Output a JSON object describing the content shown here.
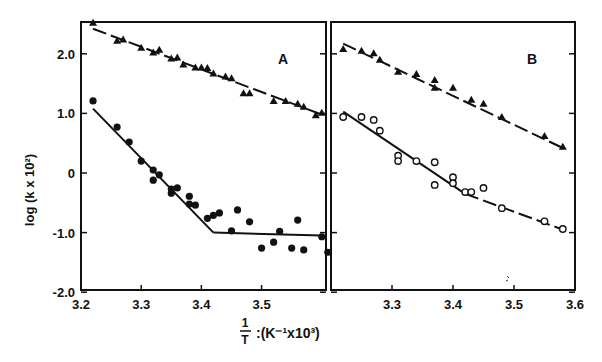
{
  "figure": {
    "ylabel": "log (k x 10²)",
    "xlabel_fraction_num": "1",
    "xlabel_fraction_den": "T",
    "xlabel_rest": ":(K⁻¹x10³)",
    "background": "#ffffff",
    "ink": "#111111"
  },
  "chart_data": [
    {
      "type": "scatter",
      "panel": "A",
      "title": "A",
      "xlabel": "1/T ; (K^-1 x 10^3)",
      "ylabel": "log (k x 10^2)",
      "xlim": [
        3.2,
        3.607
      ],
      "ylim": [
        -2.0,
        2.52
      ],
      "xticks": [
        3.2,
        3.3,
        3.4,
        3.5
      ],
      "yticks": [
        -2.0,
        -1.0,
        0,
        1.0,
        2.0
      ],
      "ytick_labels": [
        "-2.0",
        "-1.0",
        "0",
        "1.0",
        "2.0"
      ],
      "grid": false,
      "series": [
        {
          "name": "filled triangles",
          "marker": "triangle-filled",
          "x": [
            3.22,
            3.26,
            3.27,
            3.3,
            3.32,
            3.33,
            3.35,
            3.36,
            3.37,
            3.39,
            3.4,
            3.41,
            3.42,
            3.44,
            3.45,
            3.47,
            3.48,
            3.52,
            3.54,
            3.56,
            3.57,
            3.59,
            3.6
          ],
          "y": [
            2.52,
            2.22,
            2.24,
            2.1,
            2.02,
            2.07,
            1.92,
            1.94,
            1.82,
            1.77,
            1.77,
            1.76,
            1.67,
            1.62,
            1.59,
            1.34,
            1.34,
            1.21,
            1.21,
            1.16,
            1.11,
            0.97,
            1.01
          ]
        },
        {
          "name": "filled circles",
          "marker": "circle-filled",
          "x": [
            3.22,
            3.26,
            3.28,
            3.3,
            3.32,
            3.32,
            3.33,
            3.35,
            3.35,
            3.36,
            3.38,
            3.38,
            3.39,
            3.41,
            3.42,
            3.43,
            3.46,
            3.45,
            3.48,
            3.5,
            3.52,
            3.53,
            3.55,
            3.56,
            3.57,
            3.6,
            3.61
          ],
          "y": [
            1.21,
            0.77,
            0.52,
            0.2,
            0.05,
            -0.12,
            -0.03,
            -0.27,
            -0.34,
            -0.25,
            -0.39,
            -0.52,
            -0.54,
            -0.76,
            -0.71,
            -0.67,
            -0.62,
            -0.97,
            -0.82,
            -1.26,
            -1.16,
            -0.98,
            -1.26,
            -0.79,
            -1.29,
            -1.07,
            -1.33
          ]
        }
      ],
      "fit_lines": [
        {
          "name": "triangle fit",
          "style": "dashed",
          "points": [
            [
              3.22,
              2.42
            ],
            [
              3.6,
              0.98
            ]
          ]
        },
        {
          "name": "circle fit steep",
          "style": "solid-then-dashed",
          "points": [
            [
              3.22,
              1.08
            ],
            [
              3.42,
              -1.0
            ]
          ]
        },
        {
          "name": "circle fit flat",
          "style": "solid",
          "points": [
            [
              3.42,
              -1.0
            ],
            [
              3.6,
              -1.05
            ]
          ]
        }
      ]
    },
    {
      "type": "scatter",
      "panel": "B",
      "title": "B",
      "xlabel": "1/T ; (K^-1 x 10^3)",
      "ylabel": "log (k x 10^2)",
      "xlim": [
        3.2,
        3.6
      ],
      "ylim": [
        -2.0,
        2.52
      ],
      "xticks": [
        3.3,
        3.4,
        3.5,
        3.6
      ],
      "yticks": [
        -2.0,
        -1.0,
        0,
        1.0,
        2.0
      ],
      "grid": false,
      "series": [
        {
          "name": "filled triangles",
          "marker": "triangle-filled",
          "x": [
            3.22,
            3.25,
            3.27,
            3.28,
            3.31,
            3.34,
            3.37,
            3.37,
            3.4,
            3.43,
            3.45,
            3.48,
            3.55,
            3.58
          ],
          "y": [
            2.08,
            2.05,
            2.01,
            1.9,
            1.7,
            1.66,
            1.56,
            1.43,
            1.43,
            1.23,
            1.16,
            0.94,
            0.62,
            0.44
          ]
        },
        {
          "name": "open circles",
          "marker": "circle-open",
          "x": [
            3.22,
            3.25,
            3.27,
            3.28,
            3.31,
            3.31,
            3.34,
            3.37,
            3.37,
            3.4,
            3.4,
            3.42,
            3.43,
            3.45,
            3.48,
            3.55,
            3.58
          ],
          "y": [
            0.94,
            0.94,
            0.89,
            0.71,
            0.29,
            0.2,
            0.2,
            0.18,
            -0.2,
            -0.07,
            -0.17,
            -0.32,
            -0.32,
            -0.25,
            -0.59,
            -0.81,
            -0.94
          ]
        }
      ],
      "fit_lines": [
        {
          "name": "triangle fit",
          "style": "dashed",
          "points": [
            [
              3.22,
              2.17
            ],
            [
              3.58,
              0.42
            ]
          ]
        },
        {
          "name": "circle fit steep",
          "style": "solid",
          "points": [
            [
              3.22,
              1.03
            ],
            [
              3.42,
              -0.35
            ]
          ]
        },
        {
          "name": "circle fit flat",
          "style": "dashed",
          "points": [
            [
              3.42,
              -0.35
            ],
            [
              3.58,
              -0.95
            ]
          ]
        }
      ]
    }
  ]
}
